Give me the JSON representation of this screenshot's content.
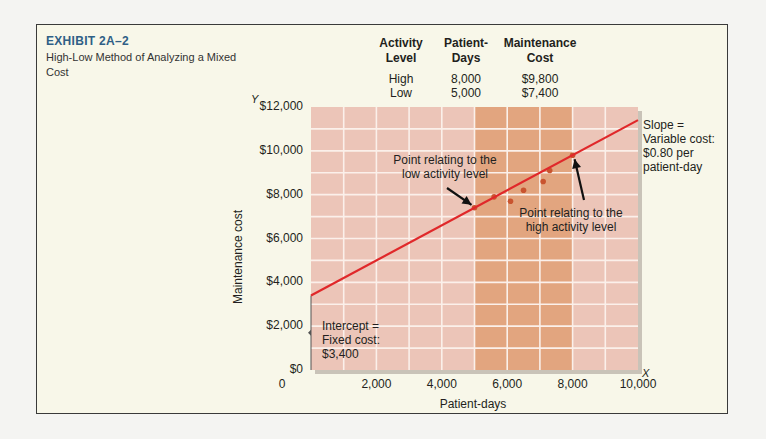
{
  "exhibit": {
    "number": "EXHIBIT 2A–2",
    "subtitle": "High-Low Method of Analyzing a Mixed Cost"
  },
  "table": {
    "headers": [
      [
        "Activity",
        "Level"
      ],
      [
        "Patient-",
        "Days"
      ],
      [
        "Maintenance",
        "Cost"
      ]
    ],
    "rows": [
      {
        "level": "High",
        "days": "8,000",
        "cost": "$9,800"
      },
      {
        "level": "Low",
        "days": "5,000",
        "cost": "$7,400"
      }
    ]
  },
  "axes": {
    "y_letter": "Y",
    "x_letter": "X",
    "ylabel": "Maintenance cost",
    "xlabel": "Patient-days",
    "yticks": [
      "$0",
      "$2,000",
      "$4,000",
      "$6,000",
      "$8,000",
      "$10,000",
      "$12,000"
    ],
    "xticks": [
      "0",
      "2,000",
      "4,000",
      "6,000",
      "8,000",
      "10,000"
    ]
  },
  "annotations": {
    "low_point": [
      "Point relating to the",
      "low activity level"
    ],
    "high_point": [
      "Point relating to the",
      "high activity level"
    ],
    "slope": [
      "Slope =",
      "Variable cost:",
      "$0.80 per",
      "patient-day"
    ],
    "intercept": [
      "Intercept =",
      "Fixed cost:",
      "$3,400"
    ]
  },
  "colors": {
    "line": "#e0282a",
    "plot_bg": "#ecc5b8",
    "band_bg": "#e2a57f",
    "dots": "#c9542f",
    "title": "#2f5f86"
  },
  "chart_data": {
    "type": "scatter",
    "title": "High-Low Method of Analyzing a Mixed Cost",
    "xlabel": "Patient-days",
    "ylabel": "Maintenance cost",
    "xlim": [
      0,
      10000
    ],
    "ylim": [
      0,
      12000
    ],
    "grid": true,
    "x_grid_step": 1000,
    "y_grid_step": 1000,
    "highlight_band_x": [
      5000,
      8000
    ],
    "points": [
      {
        "x": 5000,
        "y": 7400,
        "label": "low"
      },
      {
        "x": 5600,
        "y": 7900
      },
      {
        "x": 6100,
        "y": 7700
      },
      {
        "x": 6500,
        "y": 8200
      },
      {
        "x": 7100,
        "y": 8600
      },
      {
        "x": 7300,
        "y": 9100
      },
      {
        "x": 8000,
        "y": 9800,
        "label": "high"
      }
    ],
    "line": {
      "intercept": 3400,
      "slope": 0.8,
      "x_range": [
        0,
        10000
      ]
    },
    "fixed_cost": 3400,
    "variable_cost_per_unit": 0.8
  }
}
